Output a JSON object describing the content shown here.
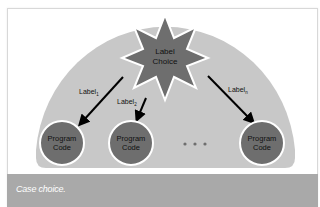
{
  "diagram": {
    "title": "Case choice",
    "center_node": {
      "line1": "Label",
      "line2": "Choice",
      "shape": "eight-point-star"
    },
    "branches": [
      {
        "label": "Label",
        "subscript": "1"
      },
      {
        "label": "Label",
        "subscript": "2"
      },
      {
        "label": "Label",
        "subscript": "n"
      }
    ],
    "targets": [
      {
        "line1": "Program",
        "line2": "Code"
      },
      {
        "line1": "Program",
        "line2": "Code"
      },
      {
        "line1": "Program",
        "line2": "Code"
      }
    ],
    "ellipsis": "• • •"
  },
  "caption": {
    "text": "Case choice."
  },
  "colors": {
    "background_shape": "#c8c8c8",
    "node_fill": "#6e6e6e",
    "node_stroke": "#ffffff",
    "arrow": "#000000",
    "caption_bar": "#a9a9a9",
    "caption_text": "#ffffff"
  }
}
